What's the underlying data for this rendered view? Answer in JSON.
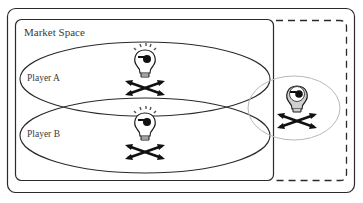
{
  "diagram": {
    "market_space_label": "Market Space",
    "players": [
      {
        "label": "Player A",
        "icon": "pirate-lightbulb-icon",
        "state": "lit"
      },
      {
        "label": "Player B",
        "icon": "pirate-lightbulb-icon",
        "state": "lit"
      }
    ],
    "external_player": {
      "label": "",
      "icon": "pirate-lightbulb-icon",
      "state": "unlit-gray"
    },
    "colors": {
      "stroke": "#2a2a2a",
      "dotted_ellipse": "#b8b8b8",
      "unlit_bulb_fill": "#cfcfcf",
      "background": "#ffffff"
    }
  }
}
